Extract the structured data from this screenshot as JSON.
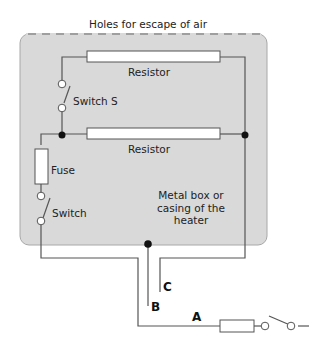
{
  "diagram": {
    "title": "Holes for escape of air",
    "labels": {
      "resistor_top": "Resistor",
      "switch_s": "Switch S",
      "resistor_middle": "Resistor",
      "fuse": "Fuse",
      "switch": "Switch",
      "casing_line1": "Metal box or",
      "casing_line2": "casing of the",
      "casing_line3": "heater",
      "wire_a": "A",
      "wire_b": "B",
      "wire_c": "C"
    },
    "colors": {
      "casing_fill": "#d9d9d9",
      "casing_border": "#9a9a9a",
      "wire": "#555555",
      "component_fill": "#ffffff",
      "junction": "#111111"
    }
  }
}
